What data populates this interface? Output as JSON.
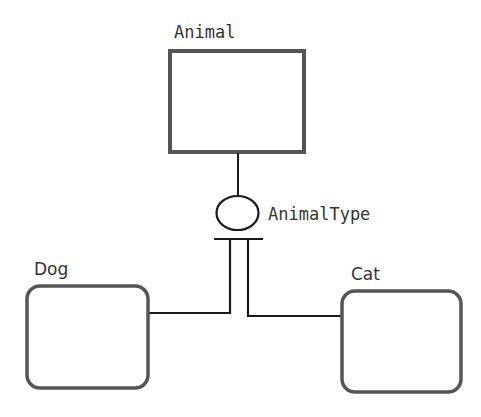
{
  "diagram": {
    "type": "entity-subtype",
    "entities": [
      {
        "id": "animal",
        "label": "Animal",
        "shape": "rectangle"
      },
      {
        "id": "dog",
        "label": "Dog",
        "shape": "rounded-rectangle"
      },
      {
        "id": "cat",
        "label": "Cat",
        "shape": "rounded-rectangle"
      }
    ],
    "discriminator": {
      "label": "AnimalType",
      "shape": "ellipse"
    },
    "relations": [
      {
        "from": "animal",
        "to": "discriminator"
      },
      {
        "from": "discriminator",
        "to": "dog"
      },
      {
        "from": "discriminator",
        "to": "cat"
      }
    ],
    "colors": {
      "box_stroke": "#555555",
      "line": "#1a1a1a",
      "text": "#333333"
    }
  }
}
